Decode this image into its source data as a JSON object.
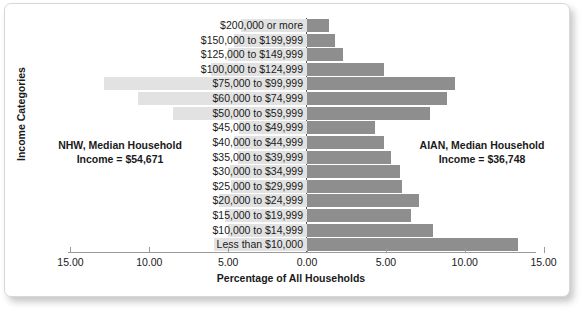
{
  "chart_data": {
    "type": "bar",
    "subtype": "diverging-population-pyramid",
    "title": "",
    "xlabel": "Percentage of All Households",
    "ylabel": "Income Categories",
    "categories": [
      "$200,000 or more",
      "$150,000 to $199,999",
      "$125,000 to $149,999",
      "$100,000 to $124,999",
      "$75,000 to $99,999",
      "$60,000 to $74,999",
      "$50,000 to $59,999",
      "$45,000 to $49,999",
      "$40,000 to $44,999",
      "$35,000 to $39,999",
      "$30,000 to $34,999",
      "$25,000 to $29,999",
      "$20,000 to $24,999",
      "$15,000 to $19,999",
      "$10,000 to $14,999",
      "Less than $10,000"
    ],
    "series": [
      {
        "name": "NHW",
        "side": "left",
        "color": "#e2e2e2",
        "values": [
          4.2,
          4.6,
          5.0,
          6.1,
          12.9,
          10.7,
          8.5,
          4.3,
          4.6,
          4.4,
          4.9,
          4.8,
          5.6,
          5.2,
          5.0,
          5.9
        ]
      },
      {
        "name": "AIAN",
        "side": "right",
        "color": "#8e8e8e",
        "values": [
          1.4,
          1.8,
          2.3,
          4.9,
          9.4,
          8.9,
          7.8,
          4.3,
          4.9,
          5.3,
          5.9,
          6.0,
          7.1,
          6.6,
          8.0,
          13.4
        ]
      }
    ],
    "xticks": [
      "15.00",
      "10.00",
      "5.00",
      "0.00",
      "5.00",
      "10.00",
      "15.00"
    ],
    "xtick_values": [
      -15,
      -10,
      -5,
      0,
      5,
      10,
      15
    ],
    "xlim": [
      -15,
      15
    ],
    "grid": false,
    "legend": "none",
    "annotations": [
      {
        "name": "nhw-median",
        "line1": "NHW, Median Household",
        "line2": "Income = $54,671",
        "position": "left"
      },
      {
        "name": "aian-median",
        "line1": "AIAN, Median Household",
        "line2": "Income = $36,748",
        "position": "right"
      }
    ]
  }
}
